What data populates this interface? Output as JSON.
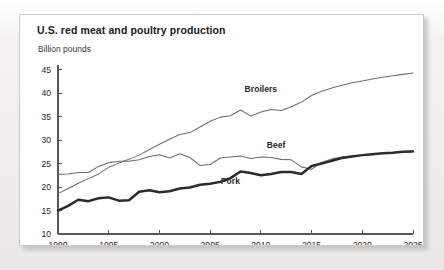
{
  "card": {
    "title": "U.S. red meat and poultry production",
    "subtitle": "Billion pounds"
  },
  "chart_data": {
    "type": "line",
    "title": "U.S. red meat and poultry production",
    "subtitle": "Billion pounds",
    "xlabel": "",
    "ylabel": "Billion pounds",
    "xlim": [
      1990,
      2025
    ],
    "ylim": [
      10,
      46
    ],
    "grid": false,
    "legend": "inline-labels",
    "xticks": [
      1990,
      1995,
      2000,
      2005,
      2010,
      2015,
      2020,
      2025
    ],
    "yticks": [
      10,
      15,
      20,
      25,
      30,
      35,
      40,
      45
    ],
    "x": [
      1990,
      1991,
      1992,
      1993,
      1994,
      1995,
      1996,
      1997,
      1998,
      1999,
      2000,
      2001,
      2002,
      2003,
      2004,
      2005,
      2006,
      2007,
      2008,
      2009,
      2010,
      2011,
      2012,
      2013,
      2014,
      2015,
      2016,
      2017,
      2018,
      2019,
      2020,
      2021,
      2022,
      2023,
      2024,
      2025
    ],
    "series": [
      {
        "name": "Broilers",
        "style": "thin-gray",
        "label_x": 2010,
        "label_y": 40.2,
        "values": [
          18.6,
          19.7,
          20.8,
          21.8,
          22.8,
          24.2,
          25.1,
          25.9,
          26.8,
          28.0,
          29.1,
          30.2,
          31.2,
          31.6,
          32.8,
          34.0,
          34.9,
          35.2,
          36.4,
          35.1,
          36.0,
          36.5,
          36.3,
          37.1,
          38.1,
          39.5,
          40.4,
          41.1,
          41.7,
          42.2,
          42.6,
          43.0,
          43.4,
          43.7,
          44.0,
          44.3
        ]
      },
      {
        "name": "Beef",
        "style": "thin-gray",
        "label_x": 2011.5,
        "label_y": 28.3,
        "values": [
          22.7,
          22.8,
          23.1,
          23.1,
          24.4,
          25.2,
          25.5,
          25.5,
          25.8,
          26.5,
          26.9,
          26.2,
          27.1,
          26.3,
          24.6,
          24.8,
          26.2,
          26.4,
          26.6,
          26.1,
          26.4,
          26.3,
          25.9,
          25.8,
          24.3,
          23.8,
          25.3,
          26.0,
          26.4,
          26.6,
          26.8,
          27.0,
          27.2,
          27.3,
          27.5,
          27.6
        ]
      },
      {
        "name": "Pork",
        "style": "thick-black",
        "label_x": 2007,
        "label_y": 20.6,
        "values": [
          15.0,
          16.0,
          17.3,
          17.0,
          17.6,
          17.8,
          17.1,
          17.2,
          19.0,
          19.3,
          18.9,
          19.1,
          19.7,
          19.9,
          20.5,
          20.7,
          21.1,
          21.9,
          23.3,
          23.0,
          22.5,
          22.8,
          23.2,
          23.2,
          22.8,
          24.5,
          25.0,
          25.6,
          26.2,
          26.5,
          26.8,
          27.0,
          27.2,
          27.3,
          27.5,
          27.6
        ]
      }
    ]
  }
}
